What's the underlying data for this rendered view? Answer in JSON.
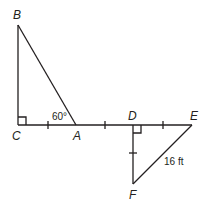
{
  "diagram": {
    "type": "geometry",
    "stroke_color": "#231f20",
    "points": {
      "B": {
        "label": "B",
        "x": 18,
        "y": 25
      },
      "C": {
        "label": "C",
        "x": 18,
        "y": 125
      },
      "A": {
        "label": "A",
        "x": 76,
        "y": 125
      },
      "D": {
        "label": "D",
        "x": 133,
        "y": 125
      },
      "E": {
        "label": "E",
        "x": 192,
        "y": 125
      },
      "F": {
        "label": "F",
        "x": 133,
        "y": 184
      }
    },
    "annotations": {
      "angle_A": "60°",
      "side_EF": "16 ft"
    },
    "segments": [
      "BC",
      "BA",
      "CE",
      "DF",
      "FE"
    ],
    "right_angles": [
      "C",
      "D"
    ],
    "congruent_ticks": [
      "CA",
      "AD",
      "DE",
      "DF"
    ]
  }
}
